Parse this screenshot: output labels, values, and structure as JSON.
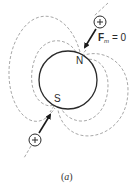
{
  "diagram": {
    "type": "magnetic-dipole-field",
    "body": {
      "shape": "circle",
      "center": [
        68,
        80
      ],
      "radius": 29
    },
    "poles": {
      "north": "N",
      "south": "S"
    },
    "force_label": {
      "symbol": "F",
      "subscript": "m",
      "relation": "= 0"
    },
    "particles": [
      {
        "charge": "+",
        "position": [
          100,
          22
        ],
        "direction": "toward-north-pole"
      },
      {
        "charge": "+",
        "position": [
          35,
          140
        ],
        "direction": "toward-south-pole"
      }
    ],
    "field_lines": {
      "style": "dashed",
      "color": "#aaaaaa",
      "count_per_side": 2
    },
    "caption": {
      "open": "(",
      "letter": "a",
      "close": ")"
    }
  },
  "colors": {
    "outline": "#2a2a2a",
    "field_line": "#a8a8a8",
    "background": "#ffffff"
  }
}
